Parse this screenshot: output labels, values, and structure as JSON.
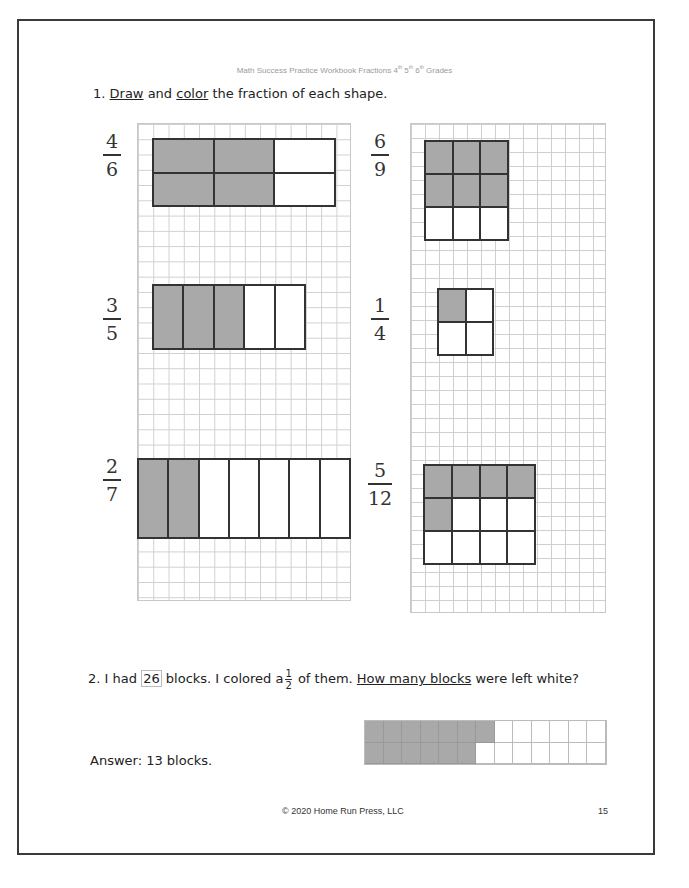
{
  "header": {
    "title": "Math Success Practice Workbook Fractions",
    "grades": [
      {
        "n": "4",
        "sup": "th"
      },
      {
        "n": "5",
        "sup": "th"
      },
      {
        "n": "6",
        "sup": "th"
      }
    ],
    "grades_suffix": "Grades"
  },
  "question1": {
    "number": "1.",
    "word1": "Draw",
    "and": "and",
    "word2": "color",
    "rest": "the fraction of each shape.",
    "problems": [
      {
        "numerator": "4",
        "denominator": "6",
        "rows": 2,
        "cols": 3,
        "shaded": [
          1,
          1,
          0,
          1,
          1,
          0
        ]
      },
      {
        "numerator": "3",
        "denominator": "5",
        "rows": 1,
        "cols": 5,
        "shaded": [
          1,
          1,
          1,
          0,
          0
        ]
      },
      {
        "numerator": "2",
        "denominator": "7",
        "rows": 1,
        "cols": 7,
        "shaded": [
          1,
          1,
          0,
          0,
          0,
          0,
          0
        ]
      },
      {
        "numerator": "6",
        "denominator": "9",
        "rows": 3,
        "cols": 3,
        "shaded": [
          1,
          1,
          1,
          1,
          1,
          1,
          0,
          0,
          0
        ]
      },
      {
        "numerator": "1",
        "denominator": "4",
        "rows": 2,
        "cols": 2,
        "shaded": [
          1,
          0,
          0,
          0
        ]
      },
      {
        "numerator": "5",
        "denominator": "12",
        "rows": 3,
        "cols": 4,
        "shaded": [
          1,
          1,
          1,
          1,
          1,
          0,
          0,
          0,
          0,
          0,
          0,
          0
        ]
      }
    ]
  },
  "question2": {
    "number": "2.",
    "text_a": "I had",
    "total": "26",
    "text_b": "blocks. I colored a",
    "frac_num": "1",
    "frac_den": "2",
    "text_c": "of them.",
    "underlined": "How many blocks",
    "text_d": "were left white?",
    "blocks": {
      "cols": 13,
      "rows": 2,
      "shaded_top": 7,
      "shaded_bottom": 6
    },
    "answer": "Answer: 13 blocks."
  },
  "footer": {
    "copyright": "© 2020 Home Run Press, LLC",
    "page": "15"
  }
}
